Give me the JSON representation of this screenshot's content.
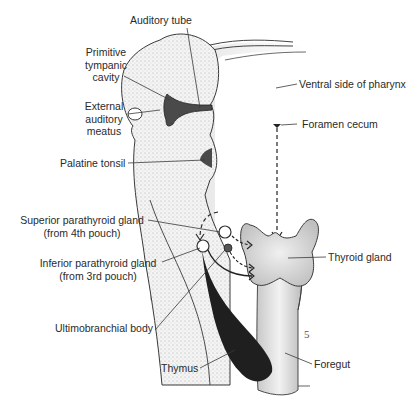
{
  "figure": {
    "labels": {
      "auditory_tube": "Auditory tube",
      "primitive_tympanic_cavity": [
        "Primitive",
        "tympanic",
        "cavity"
      ],
      "external_auditory_meatus": [
        "External",
        "auditory",
        "meatus"
      ],
      "palatine_tonsil": "Palatine tonsil",
      "superior_parathyroid": [
        "Superior parathyroid gland",
        "(from 4th pouch)"
      ],
      "inferior_parathyroid": [
        "Inferior parathyroid gland",
        "(from 3rd pouch)"
      ],
      "ultimobranchial_body": "Ultimobranchial body",
      "thymus": "Thymus",
      "ventral_side_of_pharynx": "Ventral side of pharynx",
      "foramen_cecum": "Foramen cecum",
      "thyroid_gland": "Thyroid gland",
      "foregut": "Foregut",
      "mark": "5"
    },
    "colors": {
      "stipple": "#d8d8d8",
      "dark": "#333333",
      "line": "#3a3a3a",
      "text": "#2a2a2a"
    }
  }
}
